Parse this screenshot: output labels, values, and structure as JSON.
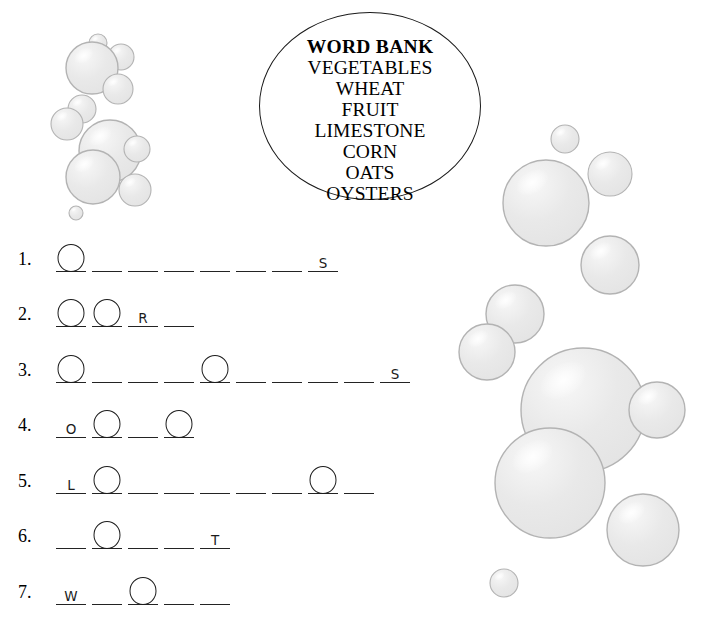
{
  "page": {
    "background_color": "#ffffff",
    "ink_color": "#1d1d1d"
  },
  "word_bank": {
    "name": "word-bank",
    "title": "WORD BANK",
    "words": [
      "VEGETABLES",
      "WHEAT",
      "FRUIT",
      "LIMESTONE",
      "CORN",
      "OATS",
      "OYSTERS"
    ]
  },
  "puzzle": {
    "rows": [
      {
        "number": "1.",
        "blank_count": 8,
        "letters": [
          "",
          "",
          "",
          "",
          "",
          "",
          "",
          "S"
        ],
        "circles": [
          1,
          0,
          0,
          0,
          0,
          0,
          0,
          0
        ]
      },
      {
        "number": "2.",
        "blank_count": 4,
        "letters": [
          "",
          "",
          "R",
          ""
        ],
        "circles": [
          1,
          1,
          0,
          0
        ]
      },
      {
        "number": "3.",
        "blank_count": 10,
        "letters": [
          "",
          "",
          "",
          "",
          "",
          "",
          "",
          "",
          "",
          "S"
        ],
        "circles": [
          1,
          0,
          0,
          0,
          1,
          0,
          0,
          0,
          0,
          0
        ]
      },
      {
        "number": "4.",
        "blank_count": 4,
        "letters": [
          "O",
          "",
          "",
          ""
        ],
        "circles": [
          0,
          1,
          0,
          1
        ]
      },
      {
        "number": "5.",
        "blank_count": 9,
        "letters": [
          "L",
          "",
          "",
          "",
          "",
          "",
          "",
          "",
          ""
        ],
        "circles": [
          0,
          1,
          0,
          0,
          0,
          0,
          0,
          1,
          0
        ]
      },
      {
        "number": "6.",
        "blank_count": 5,
        "letters": [
          "",
          "",
          "",
          "",
          "T"
        ],
        "circles": [
          0,
          1,
          0,
          0,
          0
        ]
      },
      {
        "number": "7.",
        "blank_count": 5,
        "letters": [
          "W",
          "",
          "",
          "",
          ""
        ],
        "circles": [
          0,
          0,
          1,
          0,
          0
        ]
      }
    ]
  },
  "decorations": {
    "name": "bubble-decorations",
    "fill_color": "#e8e8e8",
    "stroke_color": "#b3b3b3",
    "highlight_color": "#fbfbfb",
    "left_cluster": [
      {
        "cx": 98,
        "cy": 43,
        "r": 9
      },
      {
        "cx": 121,
        "cy": 57,
        "r": 13
      },
      {
        "cx": 92,
        "cy": 68,
        "r": 26
      },
      {
        "cx": 118,
        "cy": 89,
        "r": 15
      },
      {
        "cx": 82,
        "cy": 109,
        "r": 14
      },
      {
        "cx": 67,
        "cy": 124,
        "r": 16
      },
      {
        "cx": 110,
        "cy": 151,
        "r": 31
      },
      {
        "cx": 137,
        "cy": 149,
        "r": 13
      },
      {
        "cx": 93,
        "cy": 177,
        "r": 27
      },
      {
        "cx": 135,
        "cy": 190,
        "r": 16
      },
      {
        "cx": 76,
        "cy": 213,
        "r": 7
      }
    ],
    "right_cluster": [
      {
        "cx": 565,
        "cy": 139,
        "r": 14
      },
      {
        "cx": 610,
        "cy": 174,
        "r": 22
      },
      {
        "cx": 546,
        "cy": 203,
        "r": 43
      },
      {
        "cx": 610,
        "cy": 265,
        "r": 29
      },
      {
        "cx": 515,
        "cy": 314,
        "r": 29
      },
      {
        "cx": 487,
        "cy": 352,
        "r": 28
      },
      {
        "cx": 583,
        "cy": 410,
        "r": 62
      },
      {
        "cx": 657,
        "cy": 410,
        "r": 28
      },
      {
        "cx": 550,
        "cy": 483,
        "r": 55
      },
      {
        "cx": 643,
        "cy": 530,
        "r": 36
      },
      {
        "cx": 504,
        "cy": 583,
        "r": 14
      }
    ]
  }
}
